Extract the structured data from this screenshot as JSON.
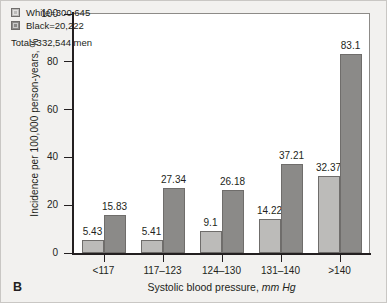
{
  "panel": {
    "letter": "B"
  },
  "legend": {
    "entries": [
      {
        "key": "white",
        "label": "White=300,645",
        "color": "#bcbbb9"
      },
      {
        "key": "black",
        "label": "Black=20,222",
        "color": "#8b8a88"
      }
    ],
    "total": "Total=332,544 men"
  },
  "axes": {
    "ylabel": "Incidence per 100,000 person-years, %",
    "xlabel_main": "Systolic blood pressure,",
    "xlabel_unit": "mm Hg",
    "yticks": [
      "0",
      "20",
      "40",
      "60",
      "80",
      "100"
    ]
  },
  "chart_data": {
    "type": "bar",
    "title": "",
    "subtitle": "",
    "xlabel": "Systolic blood pressure, mm Hg",
    "ylabel": "Incidence per 100,000 person-years, %",
    "categories": [
      "<117",
      "117–123",
      "124–130",
      "131–140",
      ">140"
    ],
    "series": [
      {
        "name": "White=300,645",
        "color": "#bcbbb9",
        "values": [
          5.43,
          5.41,
          9.1,
          14.22,
          32.37
        ]
      },
      {
        "name": "Black=20,222",
        "color": "#8b8a88",
        "values": [
          15.83,
          27.34,
          26.18,
          37.21,
          83.1
        ]
      }
    ],
    "value_labels": [
      [
        "5.43",
        "15.83"
      ],
      [
        "5.41",
        "27.34"
      ],
      [
        "9.1",
        "26.18"
      ],
      [
        "14.22",
        "37.21"
      ],
      [
        "32.37",
        "83.1"
      ]
    ],
    "ylim": [
      0,
      100
    ],
    "yticks": [
      0,
      20,
      40,
      60,
      80,
      100
    ],
    "grid": false,
    "legend_position": "top-left",
    "annotations": [
      "Total=332,544 men"
    ],
    "panel_label": "B"
  }
}
